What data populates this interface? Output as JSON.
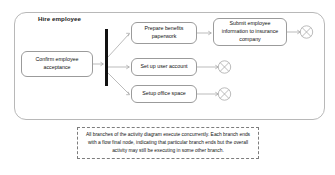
{
  "diagram": {
    "title": "Hire employee",
    "type": "UML activity diagram",
    "actions": [
      {
        "id": "confirm",
        "label": "Confirm employee acceptance"
      },
      {
        "id": "benefits",
        "label": "Prepare benefits paperwork"
      },
      {
        "id": "submit",
        "label": "Submit employee information to insurance company"
      },
      {
        "id": "account",
        "label": "Set up user account"
      },
      {
        "id": "office",
        "label": "Setup office space"
      }
    ],
    "fork": {
      "name": "fork-node"
    },
    "flow_final_nodes": [
      {
        "id": "final-top",
        "name": "flow-final-node"
      },
      {
        "id": "final-middle",
        "name": "flow-final-node"
      },
      {
        "id": "final-bottom",
        "name": "flow-final-node"
      }
    ],
    "note": {
      "line1": "All branches of the activity diagram execute concurrently.  Each branch",
      "line2": "ends with a flow final node, indicating that particular branch ends but the",
      "line3": "overall activity may still be executing in some other branch."
    },
    "colors": {
      "background": "#ffffff",
      "node_border": "#9b9b9b",
      "frame_border": "#b8b8b8",
      "connector": "#a9a9a9",
      "fork_bar": "#111111",
      "note_border": "#7d7d7d",
      "text": "#111111"
    }
  }
}
